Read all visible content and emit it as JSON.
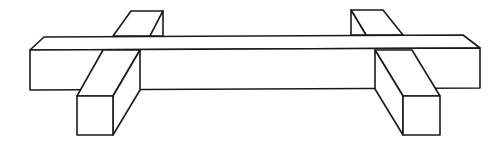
{
  "figure": {
    "stroke_color": "#1a1a1a",
    "background_color": "#ffffff",
    "parts": [
      {
        "name": "main-beam"
      },
      {
        "name": "left-cross-block"
      },
      {
        "name": "right-cross-block"
      }
    ]
  }
}
